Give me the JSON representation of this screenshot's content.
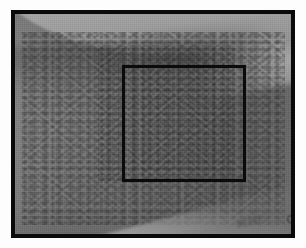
{
  "figure": {
    "kind": "clinical-photograph",
    "modality": "grayscale photograph",
    "caption": "",
    "label": ""
  },
  "frame": {
    "outer_border_color": "#0a0a0a",
    "outer_border_width_px": 4,
    "paper_margin_color": "#fdfdfd",
    "photo_width_px": 284,
    "photo_height_px": 228
  },
  "annotation": {
    "type": "region-of-interest-square",
    "shape": "square",
    "stroke_color": "#0b0b0b",
    "stroke_width_px": 3,
    "fill": "none",
    "left_px": 107,
    "top_px": 51,
    "width_px": 124,
    "height_px": 117,
    "description": "black square outlining the magnified rash region"
  },
  "scene": {
    "skin_tone_hex": "#747474",
    "highlight_band_hex": "#a7a7a7",
    "shadow_hex": "#5a5a5a",
    "rash_speckle_hex": "#2c2c2c",
    "regions": [
      {
        "name": "upper-background-band",
        "description": "lighter diagonal band across the top of the frame behind the limb"
      },
      {
        "name": "limb-surface",
        "description": "mid-gray skin occupying most of the frame, densely speckled with darker macules"
      },
      {
        "name": "lower-right-cloth",
        "description": "lighter diagonal wedge of fabric entering at the bottom right corner"
      }
    ]
  },
  "cloth_text": {
    "primary": "MBIO",
    "secondary": "UIM",
    "note": "faint mirrored lettering printed on the fabric at lower right"
  }
}
